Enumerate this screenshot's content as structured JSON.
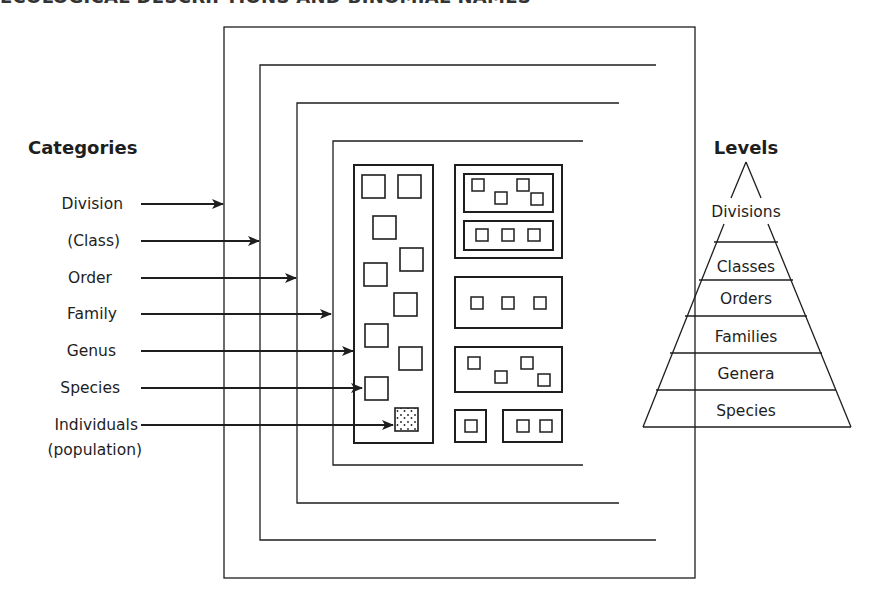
{
  "page_header": "ECOLOGICAL DESCRIPTIONS AND BINOMIAL NAMES",
  "categories": {
    "heading": "Categories",
    "items": [
      {
        "label": "Division",
        "y": 204,
        "arrow_end": 223
      },
      {
        "label": "(Class)",
        "y": 241,
        "arrow_end": 259
      },
      {
        "label": "Order",
        "y": 278,
        "arrow_end": 296
      },
      {
        "label": "Family",
        "y": 314,
        "arrow_end": 331
      },
      {
        "label": "Genus",
        "y": 351,
        "arrow_end": 353
      },
      {
        "label": "Species",
        "y": 388,
        "arrow_end": 362
      },
      {
        "label": "Individuals",
        "label2": "(population)",
        "y": 425,
        "arrow_end": 393
      }
    ]
  },
  "levels": {
    "heading": "Levels",
    "tiers": [
      "Divisions",
      "Classes",
      "Orders",
      "Families",
      "Genera",
      "Species"
    ]
  },
  "colors": {
    "line": "#1e1e1e",
    "background": "#ffffff"
  }
}
